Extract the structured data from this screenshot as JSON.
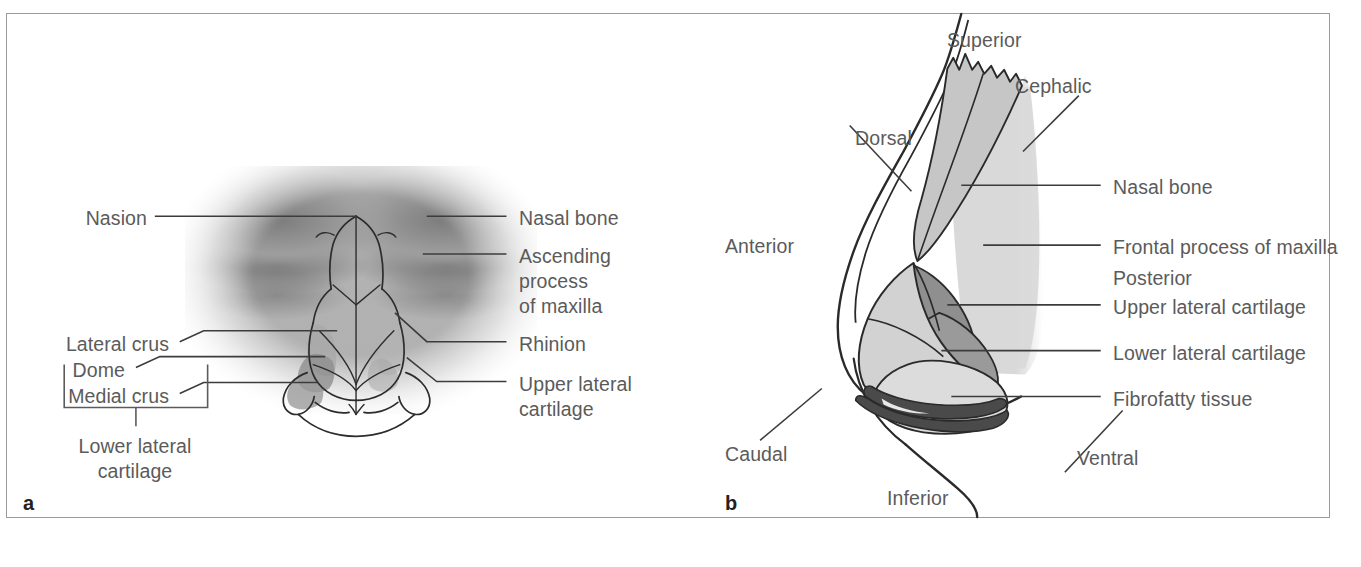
{
  "figure": {
    "panel_a_letter": "a",
    "panel_b_letter": "b"
  },
  "colors": {
    "text": "#5b5b5b",
    "letter": "#231f20",
    "leader": "#3c3c3c",
    "frame": "#9a9a9a",
    "silhouette": "#d9d9d9",
    "cartilage_light": "#d2d2d2",
    "cartilage_mid": "#b9b9b9",
    "cartilage_dark": "#8f8f8f",
    "cartilage_darkest": "#4a4a4a"
  },
  "panel_a": {
    "labels_left": [
      {
        "id": "nasion",
        "text": "Nasion"
      },
      {
        "id": "lateral-crus",
        "text": "Lateral crus"
      },
      {
        "id": "dome",
        "text": "Dome"
      },
      {
        "id": "medial-crus",
        "text": "Medial crus"
      }
    ],
    "bracket_label": {
      "id": "lower-lateral-cartilage",
      "line1": "Lower lateral",
      "line2": "cartilage"
    },
    "labels_right": [
      {
        "id": "nasal-bone",
        "text": "Nasal bone"
      },
      {
        "id": "ascending-process-of-maxilla",
        "line1": "Ascending",
        "line2": "process",
        "line3": "of maxilla"
      },
      {
        "id": "rhinion",
        "text": "Rhinion"
      },
      {
        "id": "upper-lateral-cartilage",
        "line1": "Upper lateral",
        "line2": "cartilage"
      }
    ]
  },
  "panel_b": {
    "orientation_labels": [
      {
        "id": "superior",
        "text": "Superior"
      },
      {
        "id": "cephalic",
        "text": "Cephalic"
      },
      {
        "id": "dorsal",
        "text": "Dorsal"
      },
      {
        "id": "anterior",
        "text": "Anterior"
      },
      {
        "id": "caudal",
        "text": "Caudal"
      },
      {
        "id": "inferior",
        "text": "Inferior"
      },
      {
        "id": "ventral",
        "text": "Ventral"
      }
    ],
    "structure_labels": [
      {
        "id": "nasal-bone",
        "text": "Nasal bone",
        "has_leader": true
      },
      {
        "id": "frontal-process-of-maxilla",
        "text": "Frontal process of maxilla",
        "has_leader": true
      },
      {
        "id": "posterior",
        "text": "Posterior",
        "has_leader": false
      },
      {
        "id": "upper-lateral-cartilage",
        "text": "Upper lateral cartilage",
        "has_leader": true
      },
      {
        "id": "lower-lateral-cartilage",
        "text": "Lower lateral cartilage",
        "has_leader": true
      },
      {
        "id": "fibrofatty-tissue",
        "text": "Fibrofatty tissue",
        "has_leader": true
      }
    ]
  }
}
